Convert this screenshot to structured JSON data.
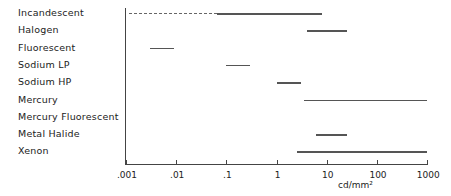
{
  "chart_data": {
    "type": "range-bar",
    "title": "",
    "xlabel": "cd/mm²",
    "ylabel": "",
    "xscale": "log",
    "xlim": [
      0.001,
      1000
    ],
    "xticks": [
      ".001",
      ".01",
      ".1",
      "1",
      "10",
      "100",
      "1000"
    ],
    "categories": [
      "Incandescent",
      "Halogen",
      "Fluorescent",
      "Sodium LP",
      "Sodium HP",
      "Mercury",
      "Mercury Fluorescent",
      "Metal Halide",
      "Xenon"
    ],
    "series": [
      {
        "name": "Incandescent",
        "dashed_range": [
          0.001,
          0.065
        ],
        "range": [
          0.065,
          8
        ]
      },
      {
        "name": "Halogen",
        "range": [
          4,
          25
        ]
      },
      {
        "name": "Fluorescent",
        "range": [
          0.003,
          0.009
        ]
      },
      {
        "name": "Sodium LP",
        "range": [
          0.1,
          0.3
        ]
      },
      {
        "name": "Sodium HP",
        "range": [
          1,
          3
        ]
      },
      {
        "name": "Mercury",
        "range": [
          3.5,
          1000
        ]
      },
      {
        "name": "Mercury Fluorescent",
        "range": null
      },
      {
        "name": "Metal Halide",
        "range": [
          6,
          25
        ]
      },
      {
        "name": "Xenon",
        "range": [
          2.5,
          1000
        ]
      }
    ],
    "grid": false,
    "legend": "none"
  },
  "labels": [
    "Incandescent",
    "Halogen",
    "Fluorescent",
    "Sodium LP",
    "Sodium HP",
    "Mercury",
    "Mercury Fluorescent",
    "Metal Halide",
    "Xenon"
  ],
  "ticks": [
    ".001",
    ".01",
    ".1",
    "1",
    "10",
    "100",
    "1000"
  ],
  "unit": "cd/mm²"
}
